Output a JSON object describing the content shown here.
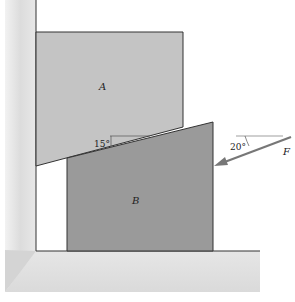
{
  "diagram": {
    "title": "",
    "blocks": [
      {
        "id": "A",
        "label": "A",
        "color": "#c4c4c4"
      },
      {
        "id": "B",
        "label": "B",
        "color": "#9a9a9a"
      }
    ],
    "wedge_angle": {
      "value": 15,
      "label": "15°"
    },
    "force": {
      "label": "F",
      "angle_deg": 20,
      "angle_label": "20°",
      "direction": "down-left toward block B"
    },
    "colors": {
      "wall": "#e2e2e2",
      "floor": "#e4e4e4",
      "outline": "#333333",
      "force_arrow": "#777777"
    }
  }
}
